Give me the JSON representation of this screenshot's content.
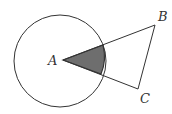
{
  "diagram": {
    "type": "geometry",
    "points": {
      "A": {
        "label": "A",
        "x": 63,
        "y": 60
      },
      "B": {
        "label": "B",
        "x": 155,
        "y": 25
      },
      "C": {
        "label": "C",
        "x": 138,
        "y": 89
      }
    },
    "circle": {
      "center": "A",
      "cx": 60,
      "cy": 61,
      "r": 46
    },
    "segments": [
      "AB",
      "BC",
      "CA"
    ],
    "shaded_region": "sector of circle between rays AB and AC",
    "colors": {
      "stroke": "#333333",
      "shade": "#6e6e6e",
      "background": "#ffffff"
    }
  }
}
